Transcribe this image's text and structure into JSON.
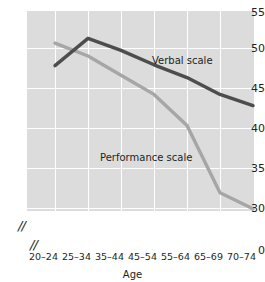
{
  "chart_data": {
    "type": "line",
    "title": "",
    "xlabel": "Age",
    "ylabel": "",
    "categories": [
      "20–24",
      "25–34",
      "35–44",
      "45–54",
      "55–64",
      "65–69",
      "70–74"
    ],
    "ylim": [
      30,
      55
    ],
    "yticks": [
      55,
      50,
      45,
      40,
      35,
      30
    ],
    "zero_tick": "0",
    "grid": true,
    "legend": "inline-labels",
    "axis_break_y": true,
    "axis_break_x": true,
    "series": [
      {
        "name": "Verbal scale",
        "color": "#4d4d4d",
        "values": [
          47.8,
          51.2,
          49.7,
          47.9,
          46.3,
          44.2,
          42.8
        ]
      },
      {
        "name": "Performance scale",
        "color": "#a6a6a6",
        "values": [
          50.6,
          49.0,
          46.6,
          44.2,
          40.3,
          31.9,
          29.9
        ]
      }
    ]
  },
  "labels": {
    "verbal": "Verbal scale",
    "performance": "Performance scale",
    "axis_x_title": "Age",
    "break_glyph": "//"
  },
  "ytick_0": "0",
  "ytick_30": "30",
  "ytick_35": "35",
  "ytick_40": "40",
  "ytick_45": "45",
  "ytick_50": "50",
  "ytick_55": "55",
  "xtick_0": "20–24",
  "xtick_1": "25–34",
  "xtick_2": "35–44",
  "xtick_3": "45–54",
  "xtick_4": "55–64",
  "xtick_5": "65–69",
  "xtick_6": "70–74"
}
